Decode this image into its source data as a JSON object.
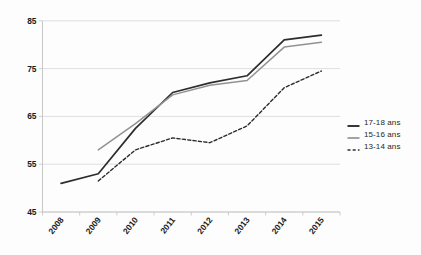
{
  "chart_data": {
    "type": "line",
    "title": "",
    "subtitle": "",
    "xlabel": "",
    "ylabel": "",
    "grid": true,
    "legend_position": "right",
    "categories": [
      "2008",
      "2009",
      "2010",
      "2011",
      "2012",
      "2013",
      "2014",
      "2015"
    ],
    "xtick_rotation": -52,
    "ylim": [
      45,
      85
    ],
    "yticks": [
      45,
      55,
      65,
      75,
      85
    ],
    "ytick_labels": [
      "45",
      "55",
      "65",
      "75",
      "85"
    ],
    "series": [
      {
        "name": "17-18 ans",
        "style": "solid",
        "color": "#2d2d2d",
        "width": 1.7,
        "values": [
          51,
          53,
          62.5,
          70,
          72,
          73.5,
          81,
          82
        ]
      },
      {
        "name": "15-16 ans",
        "style": "solid",
        "color": "#929292",
        "width": 1.5,
        "values": [
          null,
          58,
          63.5,
          69.5,
          71.5,
          72.5,
          79.5,
          80.5
        ]
      },
      {
        "name": "13-14 ans",
        "style": "dashed",
        "color": "#2d2d2d",
        "width": 1.4,
        "values": [
          null,
          51.5,
          58,
          60.5,
          59.5,
          63,
          71,
          74.5
        ]
      }
    ]
  },
  "style": {
    "grid_color": "#d7d7d7",
    "axis_color": "#c2c2c2",
    "text_color": "#1a1a1a",
    "background": "#fdfdfd"
  },
  "legend": {
    "items": [
      {
        "label": "17-18 ans"
      },
      {
        "label": "15-16 ans"
      },
      {
        "label": "13-14 ans"
      }
    ]
  }
}
